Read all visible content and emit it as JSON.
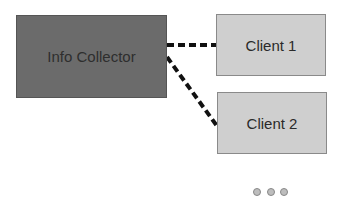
{
  "diagram": {
    "nodes": [
      {
        "id": "collector",
        "label": "Info Collector",
        "fill": "#6b6b6b"
      },
      {
        "id": "client1",
        "label": "Client 1",
        "fill": "#cfcfcf"
      },
      {
        "id": "client2",
        "label": "Client 2",
        "fill": "#cfcfcf"
      }
    ],
    "edges": [
      {
        "from": "collector",
        "to": "client1",
        "style": "dashed"
      },
      {
        "from": "collector",
        "to": "client2",
        "style": "dashed"
      }
    ],
    "ellipsis": "more clients (three dots)"
  }
}
